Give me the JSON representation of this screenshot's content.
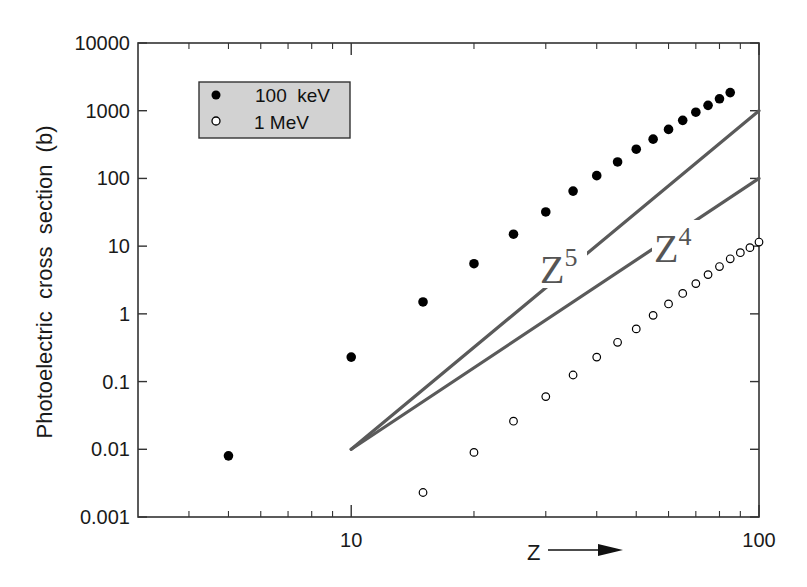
{
  "chart_data": {
    "type": "scatter",
    "title": "",
    "xlabel": "Z",
    "ylabel": "Photoelectric  cross  section  (b)",
    "xscale": "log",
    "yscale": "log",
    "xlim": [
      3,
      100
    ],
    "ylim": [
      0.001,
      10000
    ],
    "x_ticks": [
      {
        "value": 10,
        "label": "10"
      },
      {
        "value": 100,
        "label": "100"
      }
    ],
    "y_ticks": [
      {
        "value": 0.001,
        "label": "0.001"
      },
      {
        "value": 0.01,
        "label": "0.01"
      },
      {
        "value": 0.1,
        "label": "0.1"
      },
      {
        "value": 1,
        "label": "1"
      },
      {
        "value": 10,
        "label": "10"
      },
      {
        "value": 100,
        "label": "100"
      },
      {
        "value": 1000,
        "label": "1000"
      },
      {
        "value": 10000,
        "label": "10000"
      }
    ],
    "grid": false,
    "legend_position": "upper left",
    "series": [
      {
        "name": "100 keV",
        "marker": "filled-circle",
        "color": "#000000",
        "x": [
          5,
          10,
          15,
          20,
          25,
          30,
          35,
          40,
          45,
          50,
          55,
          60,
          65,
          70,
          75,
          80,
          85
        ],
        "y": [
          0.008,
          0.23,
          1.5,
          5.5,
          15,
          32,
          65,
          110,
          175,
          270,
          380,
          530,
          720,
          950,
          1200,
          1500,
          1850
        ]
      },
      {
        "name": "1 MeV",
        "marker": "open-circle",
        "color": "#000000",
        "x": [
          15,
          20,
          25,
          30,
          35,
          40,
          45,
          50,
          55,
          60,
          65,
          70,
          75,
          80,
          85,
          90,
          95,
          100
        ],
        "y": [
          0.0023,
          0.009,
          0.026,
          0.06,
          0.125,
          0.23,
          0.38,
          0.6,
          0.95,
          1.4,
          2.0,
          2.8,
          3.8,
          5.0,
          6.5,
          8.0,
          9.5,
          11.5
        ]
      }
    ],
    "reference_lines": [
      {
        "name": "Z5",
        "label_base": "Z",
        "label_exp": "5",
        "color": "#5a5a5a",
        "from": {
          "x": 10,
          "y": 0.01
        },
        "to": {
          "x": 100,
          "y": 1000
        }
      },
      {
        "name": "Z4",
        "label_base": "Z",
        "label_exp": "4",
        "color": "#5a5a5a",
        "from": {
          "x": 10,
          "y": 0.01
        },
        "to": {
          "x": 100,
          "y": 100
        }
      }
    ],
    "annotations": [
      {
        "text": "Z",
        "arrow": "right",
        "position": "below x-axis"
      }
    ]
  },
  "legend": {
    "items": [
      {
        "label": "100  keV",
        "marker": "filled"
      },
      {
        "label": "1 MeV",
        "marker": "open"
      }
    ],
    "background": "#d4d4d4"
  },
  "axes": {
    "x_title": "Z",
    "y_title": "Photoelectric  cross  section  (b)"
  },
  "labels": {
    "z5_base": "Z",
    "z5_exp": "5",
    "z4_base": "Z",
    "z4_exp": "4"
  }
}
